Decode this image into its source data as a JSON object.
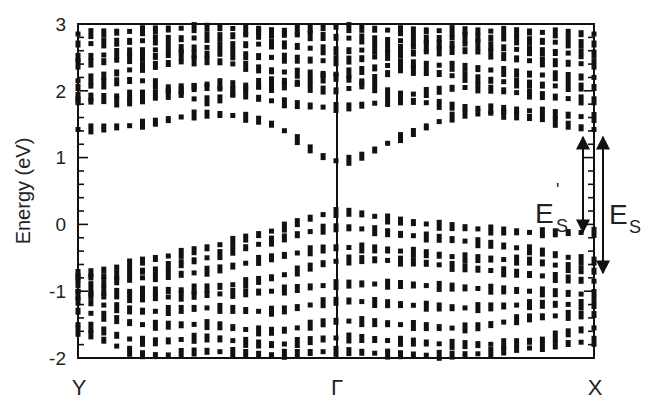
{
  "chart_data": {
    "type": "scatter",
    "title": "",
    "xlabel": "",
    "ylabel": "Energy (eV)",
    "ylim": [
      -2,
      3
    ],
    "yticks": [
      "-2",
      "-1",
      "0",
      "1",
      "2",
      "3"
    ],
    "minor_tick_step": 0.2,
    "grid": false,
    "legend": null,
    "x_kpoints": [
      {
        "label": "Y",
        "pos": 0.0
      },
      {
        "label": "Γ",
        "pos": 0.502
      },
      {
        "label": "X",
        "pos": 1.0
      }
    ],
    "vertical_lines_at": [
      0.502
    ],
    "marker": "square-dots",
    "annotations": [
      {
        "label": "E",
        "sub": "S",
        "prime": true,
        "from_eV": 1.3,
        "to_eV": -0.12,
        "description": "double arrow E'_S"
      },
      {
        "label": "E",
        "sub": "S",
        "prime": false,
        "from_eV": 1.3,
        "to_eV": -0.72,
        "description": "double arrow E_S"
      }
    ],
    "bands_note": "Band energies (eV) sampled along Y→Γ→X; columns at x = 0, 0.125, 0.25, 0.375, 0.502, 0.625, 0.75, 0.875, 1.0",
    "x": [
      0.0,
      0.125,
      0.25,
      0.375,
      0.502,
      0.625,
      0.75,
      0.875,
      1.0
    ],
    "series": [
      {
        "name": "conduction-1",
        "values": [
          1.42,
          1.5,
          1.65,
          1.5,
          0.95,
          1.3,
          1.65,
          1.6,
          1.42
        ]
      },
      {
        "name": "conduction-2",
        "values": [
          1.9,
          1.95,
          2.05,
          1.85,
          1.75,
          1.85,
          1.75,
          1.7,
          1.6
        ]
      },
      {
        "name": "conduction-3",
        "values": [
          1.85,
          1.85,
          2.1,
          2.05,
          2.2,
          1.95,
          2.05,
          1.95,
          1.85
        ]
      },
      {
        "name": "conduction-4",
        "values": [
          2.05,
          2.15,
          1.85,
          2.15,
          2.0,
          2.3,
          2.2,
          2.1,
          2.05
        ]
      },
      {
        "name": "conduction-5",
        "values": [
          2.15,
          2.35,
          2.45,
          2.3,
          2.25,
          2.4,
          2.35,
          2.25,
          2.2
        ]
      },
      {
        "name": "conduction-6",
        "values": [
          2.4,
          2.5,
          2.55,
          2.5,
          2.45,
          2.55,
          2.6,
          2.45,
          2.4
        ]
      },
      {
        "name": "conduction-7",
        "values": [
          2.5,
          2.6,
          2.65,
          2.7,
          2.6,
          2.65,
          2.7,
          2.6,
          2.55
        ]
      },
      {
        "name": "conduction-8",
        "values": [
          2.7,
          2.75,
          2.8,
          2.85,
          2.8,
          2.75,
          2.8,
          2.75,
          2.7
        ]
      },
      {
        "name": "conduction-9",
        "values": [
          2.85,
          2.9,
          2.95,
          2.9,
          2.95,
          2.9,
          2.9,
          2.88,
          2.85
        ]
      },
      {
        "name": "valence-1",
        "values": [
          -0.75,
          -0.55,
          -0.35,
          -0.1,
          0.18,
          0.05,
          -0.05,
          -0.12,
          -0.12
        ]
      },
      {
        "name": "valence-2",
        "values": [
          -0.8,
          -0.7,
          -0.5,
          -0.25,
          -0.05,
          -0.15,
          -0.25,
          -0.38,
          -0.55
        ]
      },
      {
        "name": "valence-3",
        "values": [
          -0.9,
          -0.8,
          -0.7,
          -0.5,
          -0.35,
          -0.4,
          -0.5,
          -0.55,
          -0.7
        ]
      },
      {
        "name": "valence-4",
        "values": [
          -1.0,
          -1.0,
          -0.95,
          -0.8,
          -0.55,
          -0.55,
          -0.65,
          -0.75,
          -0.85
        ]
      },
      {
        "name": "valence-5",
        "values": [
          -1.05,
          -1.1,
          -1.05,
          -1.0,
          -0.9,
          -0.9,
          -0.95,
          -1.0,
          -1.05
        ]
      },
      {
        "name": "valence-6",
        "values": [
          -1.15,
          -1.3,
          -1.25,
          -1.3,
          -1.15,
          -1.2,
          -1.25,
          -1.2,
          -1.2
        ]
      },
      {
        "name": "valence-7",
        "values": [
          -1.3,
          -1.5,
          -1.5,
          -1.6,
          -1.45,
          -1.5,
          -1.55,
          -1.4,
          -1.35
        ]
      },
      {
        "name": "valence-8",
        "values": [
          -1.5,
          -1.75,
          -1.7,
          -1.8,
          -1.7,
          -1.75,
          -1.8,
          -1.75,
          -1.55
        ]
      },
      {
        "name": "valence-9",
        "values": [
          -1.6,
          -1.95,
          -1.9,
          -1.95,
          -1.9,
          -1.95,
          -1.95,
          -1.85,
          -1.75
        ]
      }
    ]
  },
  "axis": {
    "ylabel": "Energy (eV)",
    "yticks": [
      "3",
      "2",
      "1",
      "0",
      "-1",
      "-2"
    ],
    "kpoints": [
      "Y",
      "Γ",
      "X"
    ]
  },
  "annotations": {
    "es_prime_main": "E",
    "es_prime_sub": "S",
    "es_prime_mark": "'",
    "es_main": "E",
    "es_sub": "S"
  }
}
